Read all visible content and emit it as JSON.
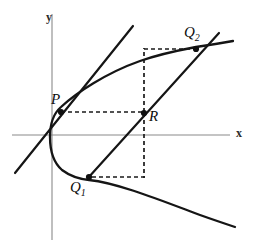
{
  "figure": {
    "kind": "geometry-diagram",
    "background_color": "#ffffff",
    "stroke_color": "#151515",
    "axis_color": "#8a8a8a",
    "axes": {
      "x_label": "x",
      "y_label": "y",
      "origin_px": [
        52,
        135
      ],
      "x_axis_extent_px": [
        12,
        230
      ],
      "y_axis_extent_px": [
        14,
        240
      ]
    },
    "points": [
      {
        "id": "P",
        "label": "P",
        "sub": "",
        "px": [
          61,
          112
        ]
      },
      {
        "id": "R",
        "label": "R",
        "sub": "",
        "px": [
          144,
          113
        ]
      },
      {
        "id": "Q1",
        "label": "Q",
        "sub": "1",
        "px": [
          89,
          177
        ]
      },
      {
        "id": "Q2",
        "label": "Q",
        "sub": "2",
        "px": [
          196,
          49
        ]
      }
    ],
    "curves": [
      {
        "id": "parabola",
        "style": "solid",
        "description": "sideways parabola opening to the right"
      }
    ],
    "lines": [
      {
        "id": "tangent-at-P",
        "style": "solid",
        "from_px": [
          15,
          173
        ],
        "to_px": [
          133,
          26
        ]
      },
      {
        "id": "secant-Q1-Q2",
        "style": "solid",
        "from_px": [
          89,
          177
        ],
        "to_px": [
          218,
          34
        ]
      }
    ],
    "dashed_paths": [
      {
        "id": "P-to-R",
        "from_px": [
          61,
          112
        ],
        "to_px": [
          144,
          112
        ]
      },
      {
        "id": "R-up-to-top",
        "from_px": [
          144,
          112
        ],
        "to_px": [
          144,
          49
        ]
      },
      {
        "id": "top-to-Q2",
        "from_px": [
          144,
          49
        ],
        "to_px": [
          196,
          49
        ]
      },
      {
        "id": "R-down-to-bottom",
        "from_px": [
          144,
          113
        ],
        "to_px": [
          144,
          177
        ]
      },
      {
        "id": "bottom-to-Q1",
        "from_px": [
          144,
          177
        ],
        "to_px": [
          89,
          177
        ]
      }
    ]
  }
}
